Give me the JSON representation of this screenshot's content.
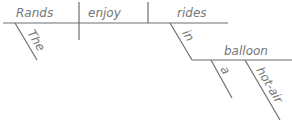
{
  "diagram": {
    "type": "sentence-diagram",
    "sentence": "The Rands enjoy rides in a hot-air balloon",
    "line_color": "#6e6e6e",
    "text_color": "#777777",
    "words": {
      "subject": "Rands",
      "verb": "enjoy",
      "object": "rides",
      "subject_modifier": "The",
      "preposition": "in",
      "prep_object": "balloon",
      "article": "a",
      "adjective": "hot-air"
    }
  }
}
